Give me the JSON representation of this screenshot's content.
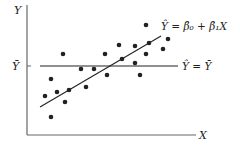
{
  "axes": {
    "y_label": "Y",
    "x_label": "X",
    "ybar_label": "Ȳ"
  },
  "lines": {
    "regression_label": "Ŷ = β̂₀ + β̂₁X",
    "mean_label": "Ŷ = Ȳ"
  },
  "colors": {
    "ink": "#222222",
    "axis": "#666666"
  },
  "points": [
    [
      63,
      54
    ],
    [
      81,
      69
    ],
    [
      94,
      69
    ],
    [
      51,
      79
    ],
    [
      86,
      87
    ],
    [
      45,
      96
    ],
    [
      57,
      92
    ],
    [
      69,
      90
    ],
    [
      65,
      102
    ],
    [
      51,
      117
    ],
    [
      146,
      25
    ],
    [
      119,
      45
    ],
    [
      135,
      46
    ],
    [
      149,
      43
    ],
    [
      168,
      39
    ],
    [
      105,
      54
    ],
    [
      122,
      59
    ],
    [
      146,
      54
    ],
    [
      163,
      49
    ],
    [
      135,
      63
    ],
    [
      107,
      75
    ],
    [
      140,
      75
    ]
  ]
}
